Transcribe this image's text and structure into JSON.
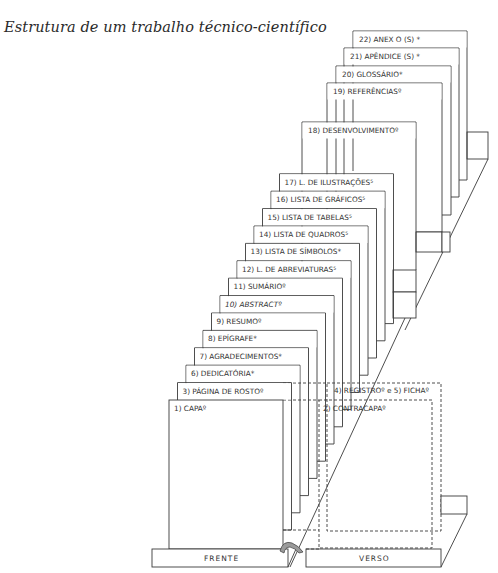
{
  "title": "Estrutura de um trabalho técnico-científico",
  "colors": {
    "line": "#3a3a3a",
    "text": "#333333",
    "background": "#ffffff"
  },
  "upper_stack": [
    {
      "label": "22) ANEX O (S) *",
      "x": 353,
      "y": 31,
      "w": 114,
      "bottom": 180
    },
    {
      "label": "21) APÊNDICE  (S) *",
      "x": 344,
      "y": 48,
      "w": 115,
      "bottom": 197
    },
    {
      "label": "20) GLOSSÁRIO*",
      "x": 336,
      "y": 66,
      "w": 115,
      "bottom": 215
    },
    {
      "label": "19) REFERÊNCIASº",
      "x": 327,
      "y": 83,
      "w": 115,
      "bottom": 232
    },
    {
      "label": "18) DESENVOLVIMENTOº",
      "x": 302,
      "y": 122,
      "w": 114,
      "bottom": 270
    }
  ],
  "lower_stack": [
    {
      "label": "17) L. DE ILUSTRAÇÕES⁵",
      "italic": false
    },
    {
      "label": "16) LISTA DE GRÁFICOS⁵",
      "italic": false
    },
    {
      "label": "15) LISTA DE TABELAS⁵",
      "italic": false
    },
    {
      "label": "14) LISTA DE QUADROS⁵",
      "italic": false
    },
    {
      "label": "13) LISTA DE SÍMBOLOS*",
      "italic": false
    },
    {
      "label": "12) L. DE ABREVIATURAS⁵",
      "italic": false
    },
    {
      "label": "11) SUMÁRIOº",
      "italic": false
    },
    {
      "label": "10) ABSTRACTº",
      "italic": true
    },
    {
      "label": "9) RESUMOº",
      "italic": false
    },
    {
      "label": "8) EPÍGRAFE*",
      "italic": false
    },
    {
      "label": "7) AGRADECIMENTOS*",
      "italic": false
    },
    {
      "label": "6) DEDICATÓRIA*",
      "italic": false
    },
    {
      "label": "3) PÁGINA DE ROSTOº",
      "italic": false
    },
    {
      "label": "1) CAPAº",
      "italic": false
    }
  ],
  "verso": {
    "registro_label": "4) REGISTROº  e  5) FICHAº",
    "contracapa_label": "2) CONTRACAPAº"
  },
  "base": {
    "front_label": "FRENTE",
    "back_label": "VERSO"
  }
}
